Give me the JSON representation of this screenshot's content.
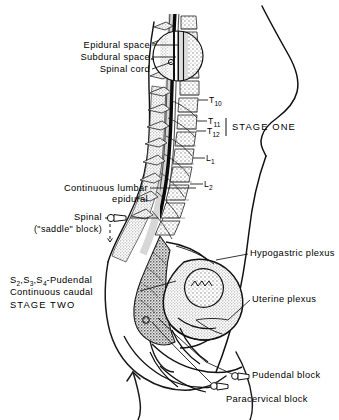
{
  "figure": {
    "type": "medical-illustration",
    "style": "black line art with gray halftone stipple on white background",
    "ink": "#000000",
    "paper": "#ffffff"
  },
  "labels": {
    "epidural_space": "Epidural space",
    "subdural_space": "Subdural space",
    "spinal_cord": "Spinal cord",
    "continuous_lumbar": "Continuous lumbar",
    "epidural": "epidural",
    "spinal": "Spinal",
    "saddle_block": "(\"saddle\" block)",
    "pudendal_roots": "S₂,S₃,S₄-Pudendal",
    "continuous_caudal": "Continuous caudal",
    "stage_two": "STAGE TWO",
    "stage_one": "STAGE ONE",
    "hypogastric_plexus": "Hypogastric plexus",
    "uterine_plexus": "Uterine plexus",
    "pudendal_block": "Pudendal block",
    "paracervical_block": "Paracervical block"
  },
  "vertebrae": [
    {
      "id": "t10",
      "label": "T",
      "sub": "10"
    },
    {
      "id": "t11",
      "label": "T",
      "sub": "11"
    },
    {
      "id": "t12",
      "label": "T",
      "sub": "12"
    },
    {
      "id": "l1",
      "label": "L",
      "sub": "1"
    },
    {
      "id": "l2",
      "label": "L",
      "sub": "2"
    }
  ],
  "icons": {
    "needle_hub": "syringe-hub-glyph",
    "down_arrow": "dashed-down-arrow"
  }
}
